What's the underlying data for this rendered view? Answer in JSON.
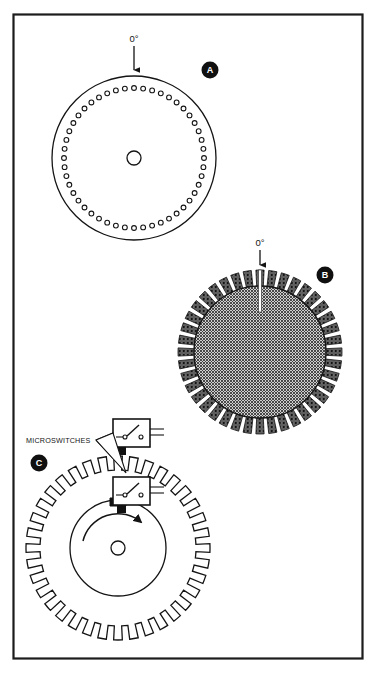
{
  "figure": {
    "background_color": "#ffffff",
    "border_color": "#1c1c1c",
    "ink_color": "#141414",
    "frame": {
      "x": 13,
      "y": 14,
      "width": 350,
      "height": 645
    }
  },
  "labels": {
    "zero_degrees_a": "0°",
    "zero_degrees_b": "0°",
    "microswitches": "MICROSWITCHES"
  },
  "badges": [
    {
      "id": "badge-a",
      "letter": "A",
      "cx": 210,
      "cy": 70,
      "r": 8.5,
      "fill": "#101010",
      "text_color": "#ffffff"
    },
    {
      "id": "badge-b",
      "letter": "B",
      "cx": 325,
      "cy": 275,
      "r": 8.5,
      "fill": "#101010",
      "text_color": "#ffffff"
    },
    {
      "id": "badge-c",
      "letter": "C",
      "cx": 39,
      "cy": 463,
      "r": 8.5,
      "fill": "#101010",
      "text_color": "#ffffff"
    }
  ],
  "diagram_a": {
    "name": "perforated-index-disc",
    "center": {
      "x": 134,
      "y": 158
    },
    "outer_radius": 82,
    "hole_ring_radius": 70,
    "hole_count": 48,
    "hole_radius": 2.4,
    "hub_radius": 7,
    "stroke_width": 1.2,
    "marker": {
      "label": "0°",
      "label_x": 134,
      "label_y": 39,
      "arrow_from_y": 45,
      "arrow_to_y": 74
    }
  },
  "diagram_b": {
    "name": "slotted-encoder-disc",
    "center": {
      "x": 260,
      "y": 352
    },
    "outer_radius": 82,
    "inner_radius": 66,
    "segment_count": 40,
    "segment_fill": "#1b1b1b",
    "disc_fill": "#8f8f8f",
    "stroke_width": 1.2,
    "slot": {
      "angle_deg": 0,
      "width": 3,
      "inner_radius": 40,
      "outer_radius": 82,
      "fill": "#ffffff"
    },
    "marker": {
      "label": "0°",
      "label_x": 260,
      "label_y": 243,
      "arrow_from_y": 249,
      "arrow_to_y": 268
    }
  },
  "diagram_c": {
    "name": "cam-wheel-with-microswitches",
    "center": {
      "x": 118,
      "y": 548
    },
    "gear_outer_radius": 92,
    "gear_root_radius": 78,
    "tooth_count": 36,
    "hub_outer_radius": 48,
    "hub_center_hole_radius": 7,
    "stroke_width": 1.2,
    "rotation_arrow": {
      "direction": "clockwise",
      "radius": 36,
      "start_deg": 195,
      "end_deg": 305
    },
    "cam_lobe": {
      "x": 111,
      "y": 492,
      "width": 14,
      "height": 14,
      "fill": "#111111"
    },
    "switches": [
      {
        "id": "microswitch-upper",
        "x": 113,
        "y": 419,
        "width": 36,
        "height": 28,
        "terminal_label": "",
        "leads": 2,
        "plunger": {
          "x": 118,
          "y": 447,
          "width": 9,
          "height": 8,
          "fill": "#111111"
        }
      },
      {
        "id": "microswitch-lower",
        "x": 113,
        "y": 477,
        "width": 36,
        "height": 28,
        "terminal_label": "",
        "leads": 2,
        "plunger": {
          "x": 118,
          "y": 505,
          "width": 9,
          "height": 8,
          "fill": "#111111"
        }
      }
    ],
    "leader": {
      "text": "MICROSWITCHES",
      "text_x": 26,
      "text_y": 443,
      "anchor_x": 96,
      "anchor_y": 440
    }
  }
}
